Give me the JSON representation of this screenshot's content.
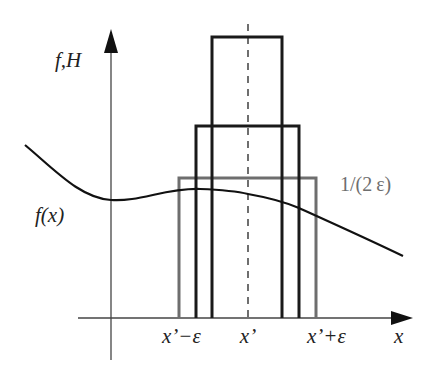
{
  "diagram": {
    "axes": {
      "y_label": "f,H",
      "x_label": "x"
    },
    "curve_label": "f(x)",
    "box_height_label": "1/(2 ε)",
    "tick_labels": {
      "left": "x’−ε",
      "center": "x’",
      "right": "x’+ε"
    },
    "colors": {
      "curve": "#111111",
      "axes": "#444444",
      "box_tall": "#1a1a1a",
      "box_mid": "#1a1a1a",
      "box_wide": "#6e6e6e",
      "label_gray": "#6e6e6e"
    },
    "boxes": [
      {
        "name": "tall",
        "x0": 212,
        "x1": 282,
        "top": 37
      },
      {
        "name": "mid",
        "x0": 196,
        "x1": 299,
        "top": 126
      },
      {
        "name": "wide",
        "x0": 179,
        "x1": 316,
        "top": 178
      }
    ]
  }
}
